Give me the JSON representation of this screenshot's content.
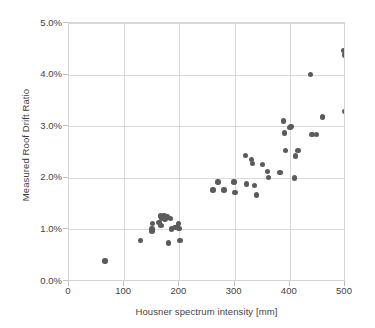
{
  "chart_data": {
    "type": "scatter",
    "title": "",
    "xlabel": "Housner spectrum intensity [mm]",
    "ylabel": "Measured Roof Drift Ratio",
    "xlim": [
      0,
      500
    ],
    "ylim": [
      0,
      5
    ],
    "xticks": [
      0,
      100,
      200,
      300,
      400,
      500
    ],
    "xtick_labels": [
      "0",
      "100",
      "200",
      "300",
      "400",
      "500"
    ],
    "yticks": [
      0,
      1,
      2,
      3,
      4,
      5
    ],
    "ytick_labels": [
      "0.0%",
      "1.0%",
      "2.0%",
      "3.0%",
      "4.0%",
      "5.0%"
    ],
    "grid": "both",
    "legend": "none",
    "marker_color": "#5b5b5b",
    "marker_shape": "circle",
    "series": [
      {
        "name": "Measured roof drift ratio vs Housner spectrum intensity",
        "points": [
          [
            65,
            0.39
          ],
          [
            130,
            0.78
          ],
          [
            150,
            0.97
          ],
          [
            150,
            1.01
          ],
          [
            151,
            1.12
          ],
          [
            163,
            1.13
          ],
          [
            166,
            1.26
          ],
          [
            167,
            1.07
          ],
          [
            168,
            1.22
          ],
          [
            172,
            1.27
          ],
          [
            174,
            1.2
          ],
          [
            178,
            1.24
          ],
          [
            180,
            0.74
          ],
          [
            184,
            1.21
          ],
          [
            186,
            1.01
          ],
          [
            192,
            1.04
          ],
          [
            197,
            1.05
          ],
          [
            198,
            1.11
          ],
          [
            199,
            1.02
          ],
          [
            201,
            0.78
          ],
          [
            261,
            1.76
          ],
          [
            270,
            1.92
          ],
          [
            281,
            1.76
          ],
          [
            299,
            1.92
          ],
          [
            301,
            1.72
          ],
          [
            320,
            2.43
          ],
          [
            321,
            1.88
          ],
          [
            331,
            2.35
          ],
          [
            332,
            2.28
          ],
          [
            336,
            1.85
          ],
          [
            340,
            1.67
          ],
          [
            350,
            2.26
          ],
          [
            360,
            2.12
          ],
          [
            361,
            2.01
          ],
          [
            382,
            2.1
          ],
          [
            389,
            3.1
          ],
          [
            390,
            2.87
          ],
          [
            392,
            2.53
          ],
          [
            400,
            2.97
          ],
          [
            402,
            2.99
          ],
          [
            408,
            2.0
          ],
          [
            410,
            2.42
          ],
          [
            415,
            2.53
          ],
          [
            438,
            4.0
          ],
          [
            440,
            2.84
          ],
          [
            448,
            2.84
          ],
          [
            459,
            3.18
          ],
          [
            498,
            4.47
          ],
          [
            499,
            4.38
          ],
          [
            500,
            3.28
          ]
        ]
      }
    ]
  },
  "axes": {
    "y_title": "Measured Roof Drift Ratio",
    "x_title": "Housner spectrum intensity [mm]"
  }
}
